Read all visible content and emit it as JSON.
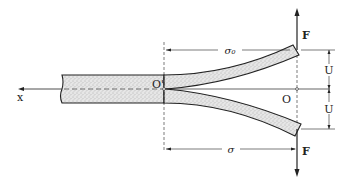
{
  "diagram": {
    "type": "double-cantilever-beam",
    "labels": {
      "axis_x": "x",
      "origin_crack_tip": "O'",
      "origin_load_point": "O",
      "force_top": "F",
      "force_bottom": "F",
      "displacement_top": "U",
      "displacement_bottom": "U",
      "crack_length_top": "σ₀",
      "crack_length_bottom": "σ"
    },
    "colors": {
      "line": "#222222",
      "fill": "#d9d9d9",
      "background": "#ffffff"
    }
  }
}
